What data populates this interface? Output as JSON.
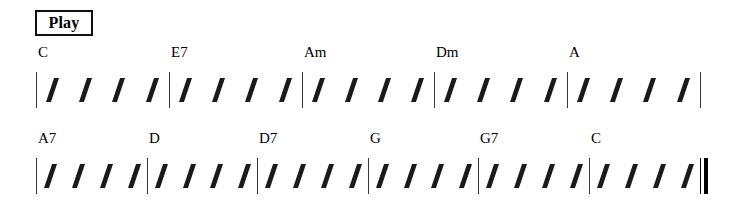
{
  "toolbar": {
    "play_label": "Play"
  },
  "sheet": {
    "beats_per_measure": 4,
    "staff_left": 36,
    "staff_right": 700,
    "rows": [
      {
        "row_index": 0,
        "measures": [
          {
            "chord": "C",
            "x": 36
          },
          {
            "chord": "E7",
            "x": 169
          },
          {
            "chord": "Am",
            "x": 302
          },
          {
            "chord": "Dm",
            "x": 434
          },
          {
            "chord": "A",
            "x": 567
          }
        ],
        "end_x": 700,
        "end_barline": "single"
      },
      {
        "row_index": 1,
        "measures": [
          {
            "chord": "A7",
            "x": 36
          },
          {
            "chord": "D",
            "x": 147
          },
          {
            "chord": "D7",
            "x": 257
          },
          {
            "chord": "G",
            "x": 368
          },
          {
            "chord": "G7",
            "x": 478
          },
          {
            "chord": "C",
            "x": 589
          }
        ],
        "end_x": 700,
        "end_barline": "final-double"
      }
    ]
  },
  "colors": {
    "background": "#ffffff",
    "ink": "#000000",
    "barline": "#3a3a3a",
    "slash": "#1a1a1a"
  }
}
